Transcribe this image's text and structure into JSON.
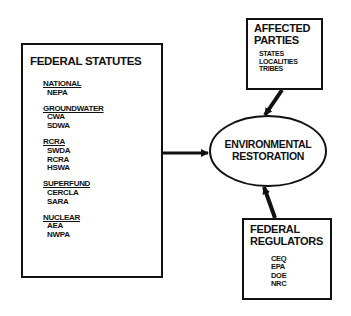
{
  "statutes": {
    "title": "FEDERAL STATUTES",
    "groups": [
      {
        "category": "NATIONAL",
        "items": [
          "NEPA"
        ]
      },
      {
        "category": "GROUNDWATER",
        "items": [
          "CWA",
          "SDWA"
        ]
      },
      {
        "category": "RCRA",
        "items": [
          "SWDA",
          "RCRA",
          "HSWA"
        ]
      },
      {
        "category": "SUPERFUND",
        "items": [
          "CERCLA",
          "SARA"
        ]
      },
      {
        "category": "NUCLEAR",
        "items": [
          "AEA",
          "NWPA"
        ]
      }
    ]
  },
  "center": {
    "line1": "ENVIRONMENTAL",
    "line2": "RESTORATION"
  },
  "affected": {
    "title1": "AFFECTED",
    "title2": "PARTIES",
    "items": [
      "STATES",
      "LOCALITIES",
      "TRIBES"
    ]
  },
  "regulators": {
    "title1": "FEDERAL",
    "title2": "REGULATORS",
    "items": [
      "CEQ",
      "EPA",
      "DOE",
      "NRC"
    ]
  }
}
